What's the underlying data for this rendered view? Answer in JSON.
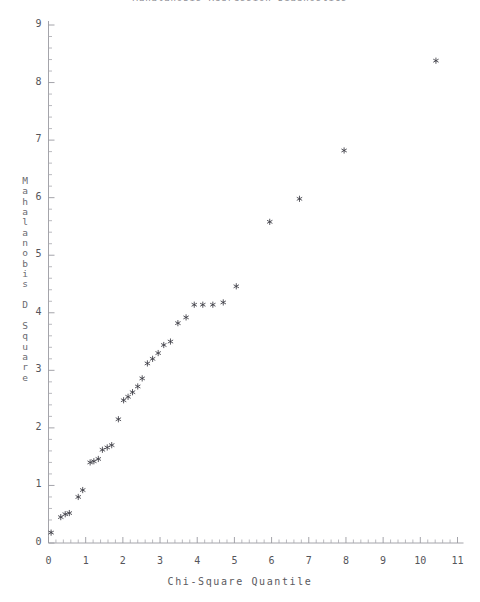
{
  "chart_data": {
    "type": "scatter",
    "title": "Mahalanobis Regression Diagnostics",
    "xlabel": "Chi-Square Quantile",
    "ylabel": "Mahalanobis D Square",
    "xlim": [
      0,
      11
    ],
    "ylim": [
      0,
      9
    ],
    "xticks": [
      0,
      1,
      2,
      3,
      4,
      5,
      6,
      7,
      8,
      9,
      10,
      11
    ],
    "yticks": [
      0,
      1,
      2,
      3,
      4,
      5,
      6,
      7,
      8,
      9
    ],
    "x_minor_ticks_per_interval": 5,
    "y_minor_ticks_per_interval": 5,
    "grid": false,
    "legend": null,
    "marker": "asterisk",
    "marker_color": "#3a3a42",
    "series": [
      {
        "name": "Observations",
        "x": [
          0.07,
          0.33,
          0.45,
          0.56,
          0.8,
          0.92,
          1.12,
          1.22,
          1.34,
          1.45,
          1.58,
          1.7,
          1.88,
          2.02,
          2.14,
          2.26,
          2.4,
          2.52,
          2.66,
          2.8,
          2.95,
          3.1,
          3.28,
          3.48,
          3.7,
          3.92,
          4.15,
          4.42,
          4.7,
          5.05,
          5.95,
          6.75,
          7.95,
          10.42
        ],
        "y": [
          0.18,
          0.45,
          0.5,
          0.52,
          0.8,
          0.92,
          1.4,
          1.42,
          1.46,
          1.62,
          1.66,
          1.7,
          2.15,
          2.48,
          2.54,
          2.62,
          2.72,
          2.86,
          3.12,
          3.2,
          3.3,
          3.44,
          3.5,
          3.82,
          3.92,
          4.14,
          4.14,
          4.14,
          4.18,
          4.46,
          5.58,
          5.98,
          6.82,
          8.38
        ]
      }
    ]
  },
  "axes": {
    "y_title_chars": [
      "M",
      "a",
      "h",
      "a",
      "l",
      "a",
      "n",
      "o",
      "b",
      "i",
      "s",
      " ",
      "D",
      " ",
      "S",
      "q",
      "u",
      "a",
      "r",
      "e"
    ]
  }
}
